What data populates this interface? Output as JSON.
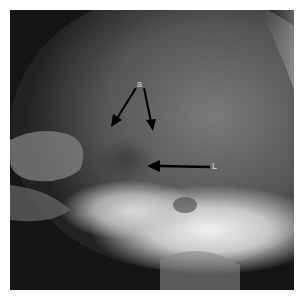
{
  "image": {
    "description": "Lateral skull radiograph with annotation arrows",
    "labels": {
      "top_label": "a",
      "right_label": "L"
    }
  }
}
